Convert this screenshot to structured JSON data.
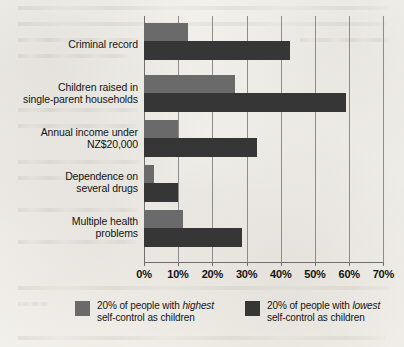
{
  "chart_data": {
    "type": "bar",
    "orientation": "horizontal",
    "title": "",
    "xlabel": "",
    "ylabel": "",
    "xlim": [
      0,
      70
    ],
    "xticks": [
      "0%",
      "10%",
      "20%",
      "30%",
      "40%",
      "50%",
      "60%",
      "70%"
    ],
    "xtick_values": [
      0,
      10,
      20,
      30,
      40,
      50,
      60,
      70
    ],
    "grid": true,
    "legend_position": "bottom",
    "categories": [
      "Criminal record",
      "Children raised in single-parent households",
      "Annual income under NZ$20,000",
      "Dependence on several drugs",
      "Multiple health problems"
    ],
    "category_lines": [
      [
        "Criminal record"
      ],
      [
        "Children raised in",
        "single-parent households"
      ],
      [
        "Annual income under",
        "NZ$20,000"
      ],
      [
        "Dependence on",
        "several drugs"
      ],
      [
        "Multiple health",
        "problems"
      ]
    ],
    "series": [
      {
        "name": "20% of people with highest self-control as children",
        "short_name": "highest self-control",
        "color": "#6a6a6a",
        "values": [
          12.8,
          26.5,
          10.0,
          3.0,
          11.3
        ]
      },
      {
        "name": "20% of people with lowest self-control as children",
        "short_name": "lowest self-control",
        "color": "#363636",
        "values": [
          42.8,
          59.0,
          33.0,
          10.0,
          28.6
        ]
      }
    ]
  },
  "legend": {
    "items": [
      {
        "swatch": "high",
        "line1_before": "20% of people with ",
        "line1_emphasis": "highest",
        "line2": "self-control as children"
      },
      {
        "swatch": "low",
        "line1_before": "20% of people with ",
        "line1_emphasis": "lowest",
        "line2": "self-control as children"
      }
    ]
  },
  "colors": {
    "background": "#f1f0eb",
    "series_high": "#6a6a6a",
    "series_low": "#363636",
    "gridline": "#8d8d8d",
    "axis": "#6f6f6f",
    "text": "#141414"
  }
}
